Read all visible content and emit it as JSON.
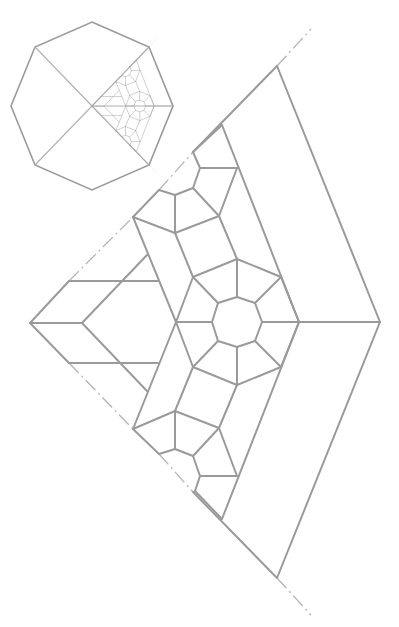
{
  "diagram": {
    "line_color": "#9a9a9a",
    "background": "#ffffff",
    "thumbnail": {
      "shape": "octagon",
      "center": [
        92,
        106
      ],
      "vertices": [
        [
          92,
          22
        ],
        [
          149,
          47
        ],
        [
          173,
          106
        ],
        [
          149,
          165
        ],
        [
          92,
          190
        ],
        [
          35,
          165
        ],
        [
          11,
          106
        ],
        [
          35,
          47
        ]
      ],
      "scale_of_detail": 0.231
    },
    "main": {
      "left_apex": [
        30,
        323
      ],
      "right_apex": [
        380,
        322
      ],
      "top_apex": [
        277,
        66
      ],
      "bottom_apex": [
        277,
        578
      ],
      "axis_of_symmetry_y": 322,
      "central_octagon_center": [
        237,
        322
      ]
    }
  }
}
